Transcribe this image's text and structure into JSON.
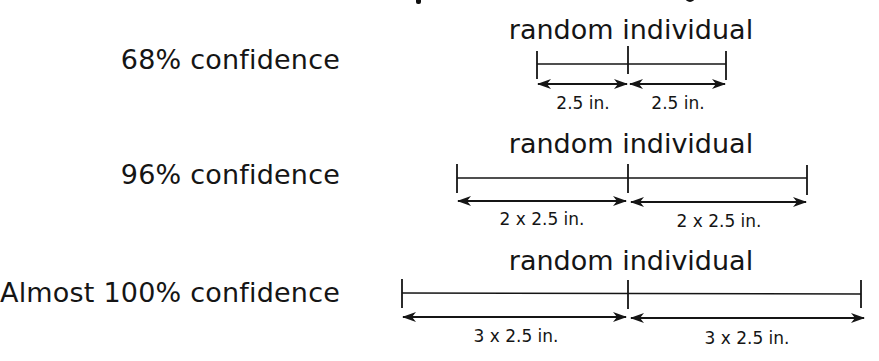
{
  "diagram": {
    "rows": [
      {
        "confidence_label": "68% confidence",
        "caption": "random individual",
        "multiplier": 1,
        "left_label": "2.5 in.",
        "right_label": "2.5 in."
      },
      {
        "confidence_label": "96% confidence",
        "caption": "random individual",
        "multiplier": 2,
        "left_label": "2 x 2.5 in.",
        "right_label": "2 x 2.5 in."
      },
      {
        "confidence_label": "Almost 100% confidence",
        "caption": "random individual",
        "multiplier": 3,
        "left_label": "3 x 2.5 in.",
        "right_label": "3 x 2.5 in."
      }
    ],
    "unit_width": "2.5 in.",
    "colors": {
      "ink": "#151515",
      "background": "#ffffff"
    }
  }
}
